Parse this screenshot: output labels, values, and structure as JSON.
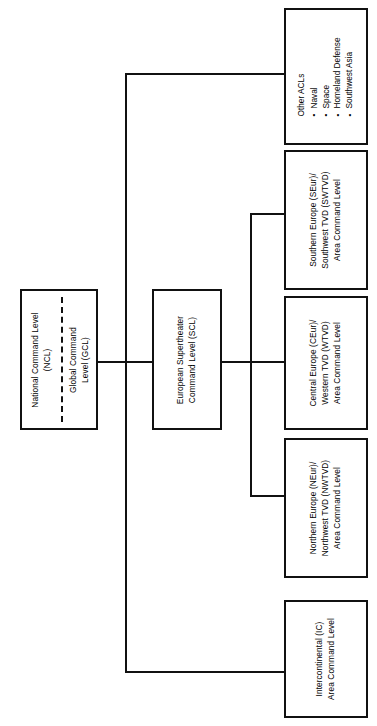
{
  "diagram": {
    "type": "organizational-hierarchy",
    "orientation": "rotated-90-ccw",
    "line_color": "#111111",
    "background_color": "#ffffff",
    "nodes": {
      "ncl": {
        "id": "national-command-level",
        "lines": [
          "National Command Level",
          "(NCL)"
        ]
      },
      "gcl": {
        "id": "global-command-level",
        "lines": [
          "Global Command",
          "Level (GCL)"
        ]
      },
      "scl": {
        "id": "european-supertheater-command-level",
        "lines": [
          "European Supertheater",
          "Command Level (SCL)"
        ]
      },
      "other_acls": {
        "id": "other-acls",
        "heading": "Other ACLs",
        "items": [
          "Naval",
          "Space",
          "Homeland Defense",
          "Southwest Asia"
        ]
      },
      "southern_europe": {
        "id": "southern-europe-area-command-level",
        "lines": [
          "Southern Europe (SEur)/",
          "Southwest TVD (SWTVD)",
          "Area Command Level"
        ]
      },
      "central_europe": {
        "id": "central-europe-area-command-level",
        "lines": [
          "Central Europe (CEur)/",
          "Western TVD (WTVD)",
          "Area Command Level"
        ]
      },
      "northern_europe": {
        "id": "northern-europe-area-command-level",
        "lines": [
          "Northern Europe (NEur)/",
          "Northwest TVD (NWTVD)",
          "Area Command Level"
        ]
      },
      "intercontinental": {
        "id": "intercontinental-area-command-level",
        "lines": [
          "Intercontinental (IC)",
          "Area Command Level"
        ]
      }
    }
  }
}
